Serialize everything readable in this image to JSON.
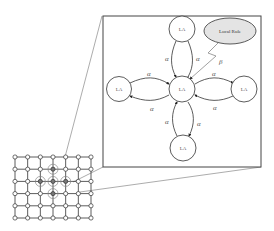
{
  "diagram": {
    "type": "cellular-learning-automata",
    "colors": {
      "stroke": "#333333",
      "light_stroke": "#888888",
      "ellipse_fill": "#e4e4e4",
      "background": "#ffffff"
    },
    "zoom_box": {
      "nodes": {
        "center": {
          "label": "LA"
        },
        "top": {
          "label": "LA"
        },
        "left": {
          "label": "LA"
        },
        "right": {
          "label": "LA"
        },
        "bottom": {
          "label": "LA"
        }
      },
      "local_rule": {
        "label": "Local Rule"
      },
      "reinforcement_label": "β",
      "edge_labels": {
        "top_left": "α",
        "top_right": "α",
        "left_top": "α",
        "left_bottom": "α",
        "right_top": "α",
        "right_bottom": "α",
        "bottom_left": "α",
        "bottom_right": "α"
      }
    },
    "grid": {
      "columns": 7,
      "rows": 6,
      "highlighted_cells": [
        [
          3,
          1
        ],
        [
          2,
          2
        ],
        [
          3,
          2
        ],
        [
          4,
          2
        ],
        [
          3,
          3
        ]
      ]
    }
  }
}
